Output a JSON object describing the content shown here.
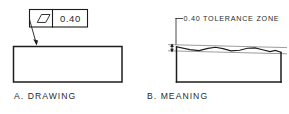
{
  "figure": {
    "background_color": "#ffffff",
    "line_color": "#1d1d1d",
    "zone_line_color": "#8a8a8a"
  },
  "panel_a": {
    "caption": "A. DRAWING",
    "feature_control_frame": {
      "symbol_name": "flatness-symbol",
      "symbol_shape": "parallelogram",
      "tolerance_value": "0.40"
    },
    "leader": {
      "name": "leader-line",
      "points_to": "top-edge-of-part"
    },
    "part": {
      "name": "part-outline-rectangle"
    }
  },
  "panel_b": {
    "caption": "B. MEANING",
    "note": "0.40 TOLERANCE ZONE",
    "dimension": {
      "name": "tolerance-zone-extent",
      "arrow_style": "double-headed-vertical"
    },
    "part": {
      "name": "part-outline-with-wavy-surface"
    },
    "zone": {
      "upper_plane_label": "upper tolerance plane",
      "lower_plane_label": "lower tolerance plane"
    }
  }
}
